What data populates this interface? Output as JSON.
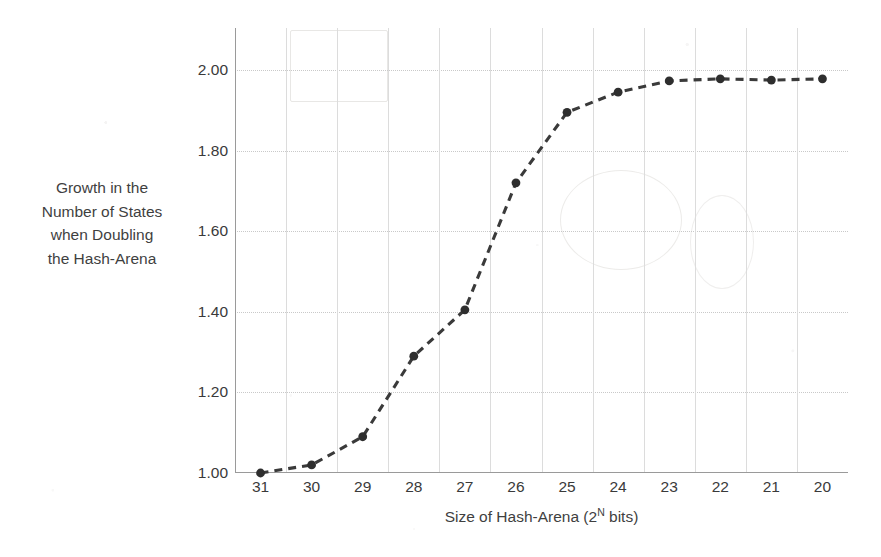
{
  "chart_data": {
    "type": "line",
    "title": "",
    "xlabel_prefix": "Size of Hash-Arena (2",
    "xlabel_sup": "N",
    "xlabel_suffix": " bits)",
    "xlabel_full": "Size of Hash-Arena (2N bits)",
    "ylabel": "Growth in the Number of States when Doubling the Hash-Arena",
    "ylabel_lines": [
      "Growth in the",
      "Number of States",
      "when Doubling",
      "the Hash-Arena"
    ],
    "categories": [
      "31",
      "30",
      "29",
      "28",
      "27",
      "26",
      "25",
      "24",
      "23",
      "22",
      "21",
      "20"
    ],
    "values": [
      1.0,
      1.02,
      1.09,
      1.29,
      1.405,
      1.72,
      1.895,
      1.945,
      1.973,
      1.978,
      1.975,
      1.978
    ],
    "ylim": [
      1.0,
      2.0
    ],
    "ytick_values": [
      1.0,
      1.2,
      1.4,
      1.6,
      1.8,
      2.0
    ],
    "ytick_labels": [
      "1.00",
      "1.20",
      "1.40",
      "1.60",
      "1.80",
      "2.00"
    ],
    "grid": {
      "horizontal": true,
      "vertical": true
    },
    "legend": {
      "visible": false,
      "position": "none"
    },
    "series_style": {
      "line_dash": "dashed",
      "line_color": "#3a3a3a",
      "marker": "circle",
      "marker_color": "#2e2e2e"
    }
  },
  "colors": {
    "background": "#ffffff",
    "text": "#3a3a3a",
    "grid": "#c9c9c9",
    "grid_vertical": "#dcdcdc",
    "axis": "#9a9a9a",
    "series": "#3a3a3a",
    "marker": "#2e2e2e"
  }
}
